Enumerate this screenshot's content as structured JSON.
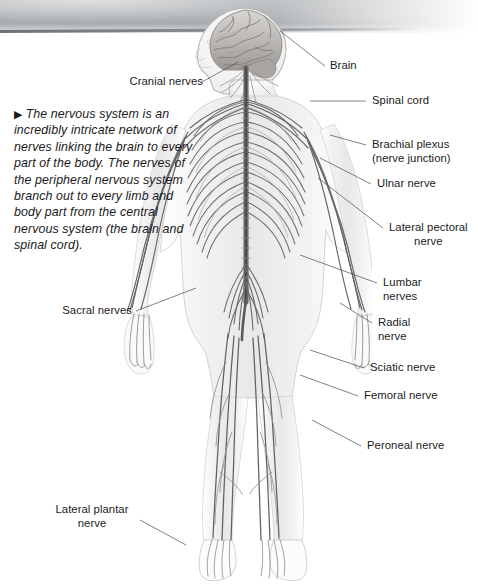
{
  "page": {
    "background_color": "#ffffff",
    "scan_band_color": "#b2b5b8",
    "ink_color": "#1b1b1b"
  },
  "caption": {
    "arrow_glyph": "▶",
    "text": "The nervous system is an incredibly intricate network of nerves linking the brain to every part of the body. The nerves of the peripheral nervous system branch out to every limb and body part from the central nervous system (the brain and spinal cord)."
  },
  "figure": {
    "parts": [
      "brain",
      "spinal cord",
      "cranial nerves",
      "intercostal nerves",
      "peripheral nerve network",
      "hands",
      "feet"
    ]
  },
  "labels": [
    {
      "id": "brain",
      "text": "Brain",
      "side": "right"
    },
    {
      "id": "cranial-nerves",
      "text": "Cranial nerves",
      "side": "left"
    },
    {
      "id": "spinal-cord",
      "text": "Spinal cord",
      "side": "right"
    },
    {
      "id": "brachial-plexus",
      "text": "Brachial plexus",
      "text2": "(nerve junction)",
      "side": "right"
    },
    {
      "id": "ulnar-nerve",
      "text": "Ulnar nerve",
      "side": "right"
    },
    {
      "id": "lateral-pectoral",
      "text": "Lateral pectoral",
      "text2": "nerve",
      "side": "right"
    },
    {
      "id": "lumbar-nerves",
      "text": "Lumbar",
      "text2": "nerves",
      "side": "right"
    },
    {
      "id": "radial-nerve",
      "text": "Radial",
      "text2": "nerve",
      "side": "right"
    },
    {
      "id": "sciatic-nerve",
      "text": "Sciatic nerve",
      "side": "right"
    },
    {
      "id": "femoral-nerve",
      "text": "Femoral nerve",
      "side": "right"
    },
    {
      "id": "peroneal-nerve",
      "text": "Peroneal nerve",
      "side": "right"
    },
    {
      "id": "sacral-nerves",
      "text": "Sacral nerves",
      "side": "left"
    },
    {
      "id": "lateral-plantar",
      "text": "Lateral plantar",
      "text2": "nerve",
      "side": "left"
    }
  ]
}
